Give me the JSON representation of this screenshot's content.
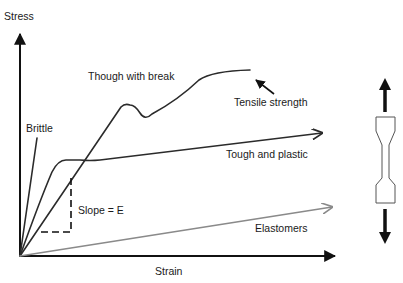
{
  "diagram": {
    "axes": {
      "y_label": "Stress",
      "x_label": "Strain"
    },
    "curves": [
      {
        "name": "brittle",
        "label": "Brittle"
      },
      {
        "name": "tough-with-break",
        "label": "Though with break"
      },
      {
        "name": "tough-and-plastic",
        "label": "Tough and plastic"
      },
      {
        "name": "elastomers",
        "label": "Elastomers"
      }
    ],
    "annotations": {
      "tensile_strength": "Tensile strength",
      "slope": "Slope = E"
    },
    "specimen": {
      "description": "dog-bone tensile test specimen with opposing force arrows"
    },
    "colors": {
      "curve": "#2b2b2b",
      "elastomer_curve": "#8a8a8a",
      "axis": "#111111"
    }
  }
}
